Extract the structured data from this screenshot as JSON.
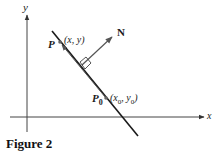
{
  "diagram": {
    "axes": {
      "x_label": "x",
      "y_label": "y"
    },
    "points": {
      "P": {
        "name": "P",
        "coords": "(x, y)"
      },
      "P0": {
        "name": "P",
        "sub": "0",
        "coords_x": "(x",
        "coords_x_sub": "0",
        "coords_sep": ", y",
        "coords_y_sub": "0",
        "coords_end": ")"
      }
    },
    "normal_vector": {
      "label": "N"
    },
    "colors": {
      "line": "#1a1a1a",
      "vector": "#555555",
      "point": "#666666"
    }
  },
  "caption": "Figure 2"
}
